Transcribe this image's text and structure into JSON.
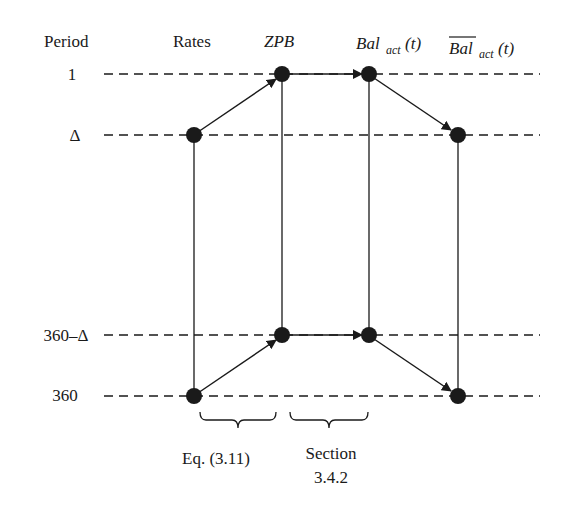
{
  "diagram": {
    "header": {
      "period": "Period",
      "rates": "Rates",
      "zpb": "ZPB",
      "bal_base": "Bal",
      "bal_sub": "act",
      "bal_arg": "(t)",
      "balbar_base": "Bal",
      "balbar_sub": "act",
      "balbar_arg": "(t)"
    },
    "periods": [
      "1",
      "Δ",
      "360–Δ",
      "360"
    ],
    "columns": [
      "Rates",
      "ZPB",
      "Bal_act(t)",
      "overline(Bal)_act(t)"
    ],
    "annotations": {
      "eq": "Eq. (3.11)",
      "section_line1": "Section",
      "section_line2": "3.4.2"
    },
    "edges": [
      {
        "from": "Rates@Δ",
        "to": "ZPB@1",
        "arrow": true
      },
      {
        "from": "ZPB@1",
        "to": "Bal_act@1",
        "arrow": true
      },
      {
        "from": "Bal_act@1",
        "to": "BalBar@Δ",
        "arrow": true
      },
      {
        "from": "Rates@360",
        "to": "ZPB@360–Δ",
        "arrow": true
      },
      {
        "from": "ZPB@360–Δ",
        "to": "Bal_act@360–Δ",
        "arrow": true
      },
      {
        "from": "Bal_act@360–Δ",
        "to": "BalBar@360",
        "arrow": true
      }
    ],
    "colors": {
      "ink": "#1a1a1a",
      "background": "#ffffff"
    }
  }
}
